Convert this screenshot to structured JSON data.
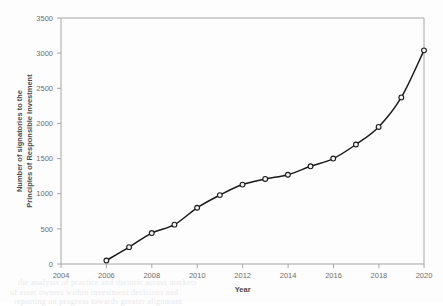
{
  "chart_data": {
    "type": "line",
    "title": "",
    "xlabel": "Year",
    "ylabel": "Number of signatories to the Principles of Responsible Investment",
    "ylabel_line1": "Number of signatories to the",
    "ylabel_line2": "Principles of Responsible Investment",
    "xlim": [
      2004,
      2020
    ],
    "ylim": [
      0,
      3500
    ],
    "xticks": [
      2004,
      2006,
      2008,
      2010,
      2012,
      2014,
      2016,
      2018,
      2020
    ],
    "xtick_labels": [
      "2004",
      "2006",
      "2008",
      "2010",
      "2012",
      "2014",
      "2016",
      "2018",
      "2020"
    ],
    "yticks": [
      0,
      500,
      1000,
      1500,
      2000,
      2500,
      3000,
      3500
    ],
    "ytick_labels": [
      "0",
      "500",
      "1000",
      "1500",
      "2000",
      "2500",
      "3000",
      "3500"
    ],
    "grid": false,
    "legend": false,
    "legend_position": "none",
    "marker": "open-circle",
    "line_color": "#1a1a1a",
    "marker_face_color": "#f2f2f2",
    "axis_color": "#a6a6a6",
    "x": [
      2006,
      2007,
      2008,
      2009,
      2010,
      2011,
      2012,
      2013,
      2014,
      2015,
      2016,
      2017,
      2018,
      2019,
      2020
    ],
    "series": [
      {
        "name": "Number of signatories",
        "values": [
          50,
          240,
          440,
          560,
          800,
          980,
          1130,
          1210,
          1270,
          1390,
          1500,
          1700,
          1950,
          2370,
          3040
        ]
      }
    ]
  },
  "artifacts": {
    "bleed_text": [
      "the analysis of practice and rhetoric across markets",
      "of asset owners within investment decisions and",
      "reporting on progress towards greater alignment"
    ]
  }
}
